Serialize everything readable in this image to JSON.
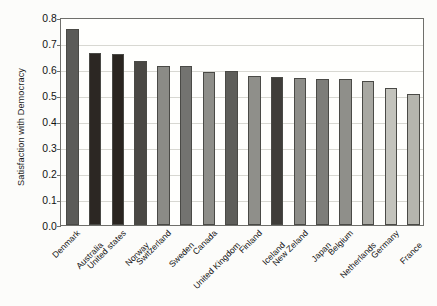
{
  "chart_data": {
    "type": "bar",
    "title": "",
    "xlabel": "",
    "ylabel": "Satisfaction with Democracy",
    "ylim": [
      0.0,
      0.8
    ],
    "ytick_labels": [
      "0.0",
      "0.1",
      "0.2",
      "0.3",
      "0.4",
      "0.5",
      "0.6",
      "0.7",
      "0.8"
    ],
    "ytick_values": [
      0.0,
      0.1,
      0.2,
      0.3,
      0.4,
      0.5,
      0.6,
      0.7,
      0.8
    ],
    "grid": true,
    "grid_axis": "y",
    "legend": "none",
    "categories": [
      "Denmark",
      "Australia",
      "United states",
      "Norway",
      "Switzerland",
      "Sweden",
      "Canada",
      "United Kingdom",
      "Finland",
      "Iceland",
      "New Zeland",
      "Japan",
      "Belgium",
      "Netherlands",
      "Germany",
      "France"
    ],
    "values": [
      0.755,
      0.66,
      0.656,
      0.63,
      0.61,
      0.61,
      0.59,
      0.592,
      0.572,
      0.568,
      0.565,
      0.563,
      0.56,
      0.555,
      0.528,
      0.505
    ],
    "bar_colors": [
      "#5b5b58",
      "#2c2723",
      "#2a2520",
      "#4a4844",
      "#8b8b86",
      "#737370",
      "#8e8e89",
      "#5e5e5a",
      "#8f8f8a",
      "#3f3d39",
      "#8d8d88",
      "#7d7d79",
      "#8f8f8a",
      "#a8a8a2",
      "#c3c3bc",
      "#b5b5ae"
    ],
    "bar_edge_color": "#4a4a46",
    "axis_color": "#6f6f6b",
    "gridline_color": "#d8d8d2",
    "plot_background": "#fffffd",
    "figure_background": "#fcfcfa"
  }
}
